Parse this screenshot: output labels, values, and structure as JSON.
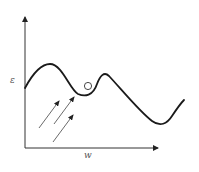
{
  "diagram": {
    "type": "energy-landscape",
    "axes": {
      "x_label": "w",
      "y_label": "ε"
    },
    "curve": {
      "description": "loss landscape with local maxima and minima",
      "color": "#1a1a1a"
    },
    "ball": {
      "description": "small circle resting in local minimum",
      "color": "#333333"
    },
    "arrows": {
      "count": 3,
      "description": "parallel arrows pointing up-right toward curve",
      "color": "#333333"
    },
    "colors": {
      "axis": "#333333",
      "background": "#ffffff"
    }
  }
}
